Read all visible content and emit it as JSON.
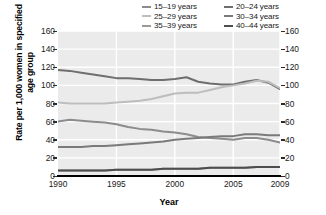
{
  "chart_data": {
    "type": "line",
    "title": "",
    "xlabel": "Year",
    "ylabel": "Rate per 1,000 women in specified age group",
    "xlim": [
      1990,
      2009
    ],
    "ylim": [
      0,
      160
    ],
    "ytick_labels": [
      "0",
      "20",
      "40",
      "60",
      "80",
      "100",
      "120",
      "140",
      "160"
    ],
    "ytick_values": [
      0,
      20,
      40,
      60,
      80,
      100,
      120,
      140,
      160
    ],
    "xtick_labels": [
      "1990",
      "1995",
      "2000",
      "2005",
      "2009"
    ],
    "xtick_values": [
      1990,
      1995,
      2000,
      2005,
      2009
    ],
    "grid": "horizontal-and-vertical-white-on-gray",
    "legend_position": "top-center",
    "x": [
      1990,
      1991,
      1992,
      1993,
      1994,
      1995,
      1996,
      1997,
      1998,
      1999,
      2000,
      2001,
      2002,
      2003,
      2004,
      2005,
      2006,
      2007,
      2008,
      2009
    ],
    "series": [
      {
        "name": "15–19 years",
        "color": "#8c8c8c",
        "values": [
          60,
          62,
          61,
          60,
          59,
          57,
          54,
          52,
          51,
          49,
          48,
          46,
          43,
          42,
          41,
          40,
          42,
          42,
          40,
          37
        ]
      },
      {
        "name": "20–24 years",
        "color": "#6e6e6e",
        "values": [
          117,
          116,
          114,
          112,
          110,
          108,
          108,
          107,
          106,
          106,
          107,
          109,
          104,
          102,
          101,
          101,
          104,
          106,
          103,
          96
        ]
      },
      {
        "name": "25–29 years",
        "color": "#bdbdbd",
        "values": [
          81,
          80,
          80,
          80,
          80,
          81,
          82,
          83,
          85,
          88,
          91,
          92,
          92,
          95,
          98,
          100,
          102,
          105,
          104,
          97
        ]
      },
      {
        "name": "30–34 years",
        "color": "#7a7a7a",
        "values": [
          32,
          32,
          32,
          33,
          33,
          34,
          35,
          36,
          37,
          38,
          40,
          41,
          42,
          43,
          44,
          44,
          46,
          46,
          45,
          45
        ]
      },
      {
        "name": "35–39 years",
        "color": "#9a9a9a",
        "values": [
          6,
          6,
          6,
          6,
          6,
          7,
          7,
          7,
          7,
          8,
          8,
          8,
          8,
          9,
          9,
          9,
          9,
          10,
          10,
          10
        ]
      },
      {
        "name": "40–44 years",
        "color": "#4d4d4d",
        "values": [
          6,
          6,
          6,
          6,
          6,
          7,
          7,
          7,
          7,
          8,
          8,
          8,
          8,
          9,
          9,
          9,
          9,
          10,
          10,
          10
        ]
      }
    ]
  },
  "legend": {
    "items": [
      {
        "label": "15–19 years",
        "color": "#8c8c8c"
      },
      {
        "label": "20–24 years",
        "color": "#6e6e6e"
      },
      {
        "label": "25–29 years",
        "color": "#bdbdbd"
      },
      {
        "label": "30–34 years",
        "color": "#7a7a7a"
      },
      {
        "label": "35–39 years",
        "color": "#9a9a9a"
      },
      {
        "label": "40–44 years",
        "color": "#4d4d4d"
      }
    ]
  },
  "axes": {
    "y_title": "Rate per 1,000 women in specified age group",
    "x_title": "Year"
  }
}
